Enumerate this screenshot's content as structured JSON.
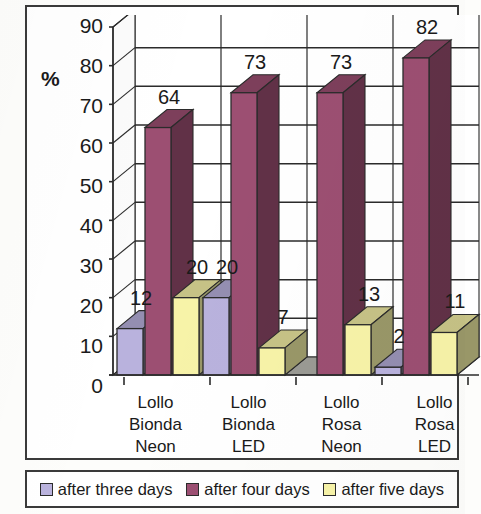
{
  "axis_title": "%",
  "y_ticks": [
    "90",
    "80",
    "70",
    "60",
    "50",
    "40",
    "30",
    "20",
    "10",
    "0"
  ],
  "categories_multiline": [
    [
      "Lollo",
      "Bionda",
      "Neon"
    ],
    [
      "Lollo",
      "Bionda",
      "LED"
    ],
    [
      "Lollo",
      "Rosa",
      "Neon"
    ],
    [
      "Lollo",
      "Rosa",
      "LED"
    ]
  ],
  "legend": [
    {
      "label": "after three days",
      "color": "#b9b2dd"
    },
    {
      "label": "after four days",
      "color": "#9c4f72"
    },
    {
      "label": "after five days",
      "color": "#f7f3a8"
    }
  ],
  "colors": {
    "series_three_days": "#b9b2dd",
    "series_four_days": "#9c4f72",
    "series_five_days": "#f7f3a8",
    "floor": "#9a9a94",
    "outline": "#2b2b2b",
    "gridline": "#2b2b2b",
    "wall": "#ffffff"
  },
  "chart_data": {
    "type": "bar",
    "title": "",
    "xlabel": "",
    "ylabel": "%",
    "ylim": [
      0,
      90
    ],
    "ytick_step": 10,
    "grid": true,
    "legend_position": "bottom",
    "three_d": true,
    "categories": [
      "Lollo Bionda Neon",
      "Lollo Bionda LED",
      "Lollo Rosa Neon",
      "Lollo Rosa LED"
    ],
    "series": [
      {
        "name": "after three days",
        "color": "#b9b2dd",
        "values": [
          12,
          20,
          null,
          2
        ]
      },
      {
        "name": "after four days",
        "color": "#9c4f72",
        "values": [
          64,
          73,
          73,
          82
        ]
      },
      {
        "name": "after five days",
        "color": "#f7f3a8",
        "values": [
          20,
          7,
          13,
          11
        ]
      }
    ],
    "data_labels": [
      {
        "category": "Lollo Bionda Neon",
        "series": "after three days",
        "value": 12
      },
      {
        "category": "Lollo Bionda Neon",
        "series": "after four days",
        "value": 64
      },
      {
        "category": "Lollo Bionda Neon",
        "series": "after five days",
        "value": 20
      },
      {
        "category": "Lollo Bionda LED",
        "series": "after three days",
        "value": 20
      },
      {
        "category": "Lollo Bionda LED",
        "series": "after four days",
        "value": 73
      },
      {
        "category": "Lollo Bionda LED",
        "series": "after five days",
        "value": 7
      },
      {
        "category": "Lollo Rosa Neon",
        "series": "after four days",
        "value": 73
      },
      {
        "category": "Lollo Rosa Neon",
        "series": "after five days",
        "value": 13
      },
      {
        "category": "Lollo Rosa LED",
        "series": "after three days",
        "value": 2
      },
      {
        "category": "Lollo Rosa LED",
        "series": "after four days",
        "value": 82
      },
      {
        "category": "Lollo Rosa LED",
        "series": "after five days",
        "value": 11
      }
    ]
  }
}
